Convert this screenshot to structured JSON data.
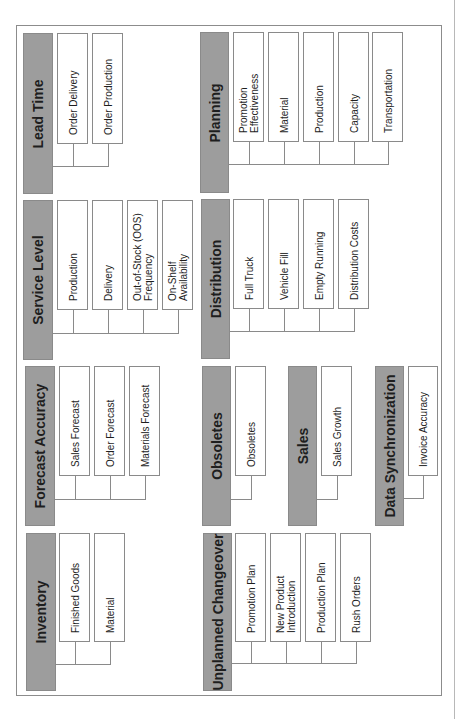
{
  "groups": [
    {
      "id": "lead-time",
      "title": "Lead Time",
      "header": {
        "x": 23,
        "y": 33,
        "w": 30,
        "h": 161
      },
      "items": [
        {
          "label": "Order Delivery",
          "x": 57,
          "w": 31
        },
        {
          "label": "Order Production",
          "x": 92,
          "w": 31
        }
      ],
      "leaf_y": 33,
      "leaf_h": 111,
      "connector_y": 166
    },
    {
      "id": "service-level",
      "title": "Service Level",
      "header": {
        "x": 23,
        "y": 200,
        "w": 30,
        "h": 160
      },
      "items": [
        {
          "label": "Production",
          "x": 57,
          "w": 31
        },
        {
          "label": "Delivery",
          "x": 92,
          "w": 31
        },
        {
          "label": "Out-of-Stock (OOS)\nFrequency",
          "x": 127,
          "w": 31
        },
        {
          "label": "On-Shelf\nAvailability",
          "x": 162,
          "w": 31
        }
      ],
      "leaf_y": 200,
      "leaf_h": 110,
      "connector_y": 333
    },
    {
      "id": "forecast-accuracy",
      "title": "Forecast Accuracy",
      "header": {
        "x": 25,
        "y": 366,
        "w": 30,
        "h": 160
      },
      "items": [
        {
          "label": "Sales Forecast",
          "x": 59,
          "w": 31
        },
        {
          "label": "Order Forecast",
          "x": 94,
          "w": 31
        },
        {
          "label": "Materials Forecast",
          "x": 129,
          "w": 31
        }
      ],
      "leaf_y": 366,
      "leaf_h": 110,
      "connector_y": 499
    },
    {
      "id": "inventory",
      "title": "Inventory",
      "header": {
        "x": 26,
        "y": 533,
        "w": 30,
        "h": 158
      },
      "items": [
        {
          "label": "Finished Goods",
          "x": 59,
          "w": 31
        },
        {
          "label": "Material",
          "x": 94,
          "w": 31
        }
      ],
      "leaf_y": 533,
      "leaf_h": 109,
      "connector_y": 664
    },
    {
      "id": "planning",
      "title": "Planning",
      "header": {
        "x": 200,
        "y": 32,
        "w": 29,
        "h": 161
      },
      "items": [
        {
          "label": "Promotion\nEffectiveness",
          "x": 233,
          "w": 31
        },
        {
          "label": "Material",
          "x": 268,
          "w": 31
        },
        {
          "label": "Production",
          "x": 303,
          "w": 31
        },
        {
          "label": "Capacity",
          "x": 338,
          "w": 31
        },
        {
          "label": "Transportation",
          "x": 372,
          "w": 31
        }
      ],
      "leaf_y": 32,
      "leaf_h": 110,
      "connector_y": 164
    },
    {
      "id": "distribution",
      "title": "Distribution",
      "header": {
        "x": 201,
        "y": 199,
        "w": 29,
        "h": 160
      },
      "items": [
        {
          "label": "Full Truck",
          "x": 233,
          "w": 31
        },
        {
          "label": "Vehicle Fill",
          "x": 268,
          "w": 31
        },
        {
          "label": "Empty Running",
          "x": 303,
          "w": 31
        },
        {
          "label": "Distribution Costs",
          "x": 338,
          "w": 31
        }
      ],
      "leaf_y": 199,
      "leaf_h": 110,
      "connector_y": 331
    },
    {
      "id": "obsoletes",
      "title": "Obsoletes",
      "header": {
        "x": 202,
        "y": 366,
        "w": 29,
        "h": 160
      },
      "items": [
        {
          "label": "Obsoletes",
          "x": 235,
          "w": 31
        }
      ],
      "leaf_y": 366,
      "leaf_h": 110,
      "connector_y": 499
    },
    {
      "id": "sales",
      "title": "Sales",
      "header": {
        "x": 288,
        "y": 366,
        "w": 29,
        "h": 160
      },
      "items": [
        {
          "label": "Sales Growth",
          "x": 321,
          "w": 31
        }
      ],
      "leaf_y": 366,
      "leaf_h": 110,
      "connector_y": 499
    },
    {
      "id": "data-synchronization",
      "title": "Data Synchronization",
      "header": {
        "x": 375,
        "y": 366,
        "w": 29,
        "h": 160
      },
      "items": [
        {
          "label": "Invoice Accuracy",
          "x": 408,
          "w": 30
        }
      ],
      "leaf_y": 366,
      "leaf_h": 110,
      "connector_y": 498
    },
    {
      "id": "unplanned-changeover",
      "title": "Unplanned Changeover",
      "header": {
        "x": 203,
        "y": 533,
        "w": 29,
        "h": 158
      },
      "items": [
        {
          "label": "Promotion Plan",
          "x": 235,
          "w": 31
        },
        {
          "label": "New Product\nIntroduction",
          "x": 270,
          "w": 31
        },
        {
          "label": "Production Plan",
          "x": 305,
          "w": 31
        },
        {
          "label": "Rush Orders",
          "x": 340,
          "w": 31
        }
      ],
      "leaf_y": 533,
      "leaf_h": 109,
      "connector_y": 663
    }
  ],
  "colors": {
    "header_fill": "#9d9d9d",
    "border": "#8a8a8a",
    "text": "#1e1e1e",
    "background": "#ffffff"
  }
}
